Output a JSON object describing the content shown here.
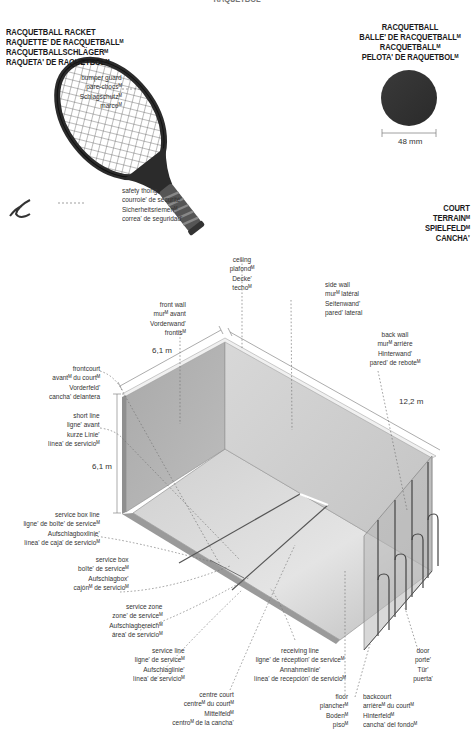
{
  "page_title": "RAQUETBOL",
  "racket": {
    "heading": [
      "RACQUETBALL RACKET",
      "RAQUETTE' DE RACQUETBALLᴹ",
      "RACQUETBALLSCHLÄGERᴹ",
      "RAQUETA' DE RAQUETBOLᴹ"
    ],
    "labels": {
      "bumper_guard": [
        "bumper guard",
        "pare-chocsᴹ",
        "Schlagschutzᴹ",
        "marcoᴹ"
      ],
      "safety_thong": [
        "safety thong",
        "courroie' de sécurité'",
        "Sicherheitsriemenᴹ",
        "correa' de seguridad'"
      ]
    }
  },
  "ball": {
    "heading": [
      "RACQUETBALL",
      "BALLE' DE RACQUETBALLᴹ",
      "RACQUETBALLᴹ",
      "PELOTA' DE RAQUETBOLᴹ"
    ],
    "diameter": "48 mm",
    "color": "#333333"
  },
  "court": {
    "heading": [
      "COURT",
      "TERRAINᴹ",
      "SPIELFELDᴹ",
      "CANCHA'"
    ],
    "dimensions": {
      "front_width": "6,1 m",
      "height": "6,1 m",
      "length": "12,2 m"
    },
    "labels": {
      "ceiling": [
        "ceiling",
        "plafondᴹ",
        "Decke'",
        "techoᴹ"
      ],
      "front_wall": [
        "front wall",
        "murᴹ avant",
        "Vorderwand'",
        "frontisᴹ"
      ],
      "side_wall": [
        "side wall",
        "murᴹ latéral",
        "Seitenwand'",
        "pared' lateral"
      ],
      "back_wall": [
        "back wall",
        "murᴹ arrière",
        "Hinterwand'",
        "pared' de reboteᴹ"
      ],
      "frontcourt": [
        "frontcourt",
        "avantᴹ du courtᴹ",
        "Vorderfeld'",
        "cancha' delantera"
      ],
      "short_line": [
        "short line",
        "ligne' avant",
        "kurze Linie'",
        "línea' de servicioᴹ"
      ],
      "service_box_line": [
        "service box line",
        "ligne' de boîte' de serviceᴹ",
        "Aufschlagboxlinie'",
        "línea' de caja' de servicioᴹ"
      ],
      "service_box": [
        "service box",
        "boîte' de serviceᴹ",
        "Aufschlagbox'",
        "cajónᴹ de servicioᴹ"
      ],
      "service_zone": [
        "service zone",
        "zone' de serviceᴹ",
        "Aufschlagbereichᴹ",
        "área' de servicioᴹ"
      ],
      "service_line": [
        "service line",
        "ligne' de serviceᴹ",
        "Aufschlaglinie'",
        "línea' de servicioᴹ"
      ],
      "centre_court": [
        "centre court",
        "centreᴹ du courtᴹ",
        "Mittelfeldᴹ",
        "centroᴹ de la cancha'"
      ],
      "receiving_line": [
        "receiving line",
        "ligne' de réception' de serviceᴹ",
        "Annahmelinie'",
        "línea' de recepción' de servicioᴹ"
      ],
      "floor": [
        "floor",
        "plancherᴹ",
        "Bodenᴹ",
        "pisoᴹ"
      ],
      "backcourt": [
        "backcourt",
        "arrièreᴹ du courtᴹ",
        "Hinterfeldᴹ",
        "cancha' del fondoᴹ"
      ],
      "door": [
        "door",
        "porte'",
        "Tür'",
        "puerta'"
      ]
    }
  }
}
